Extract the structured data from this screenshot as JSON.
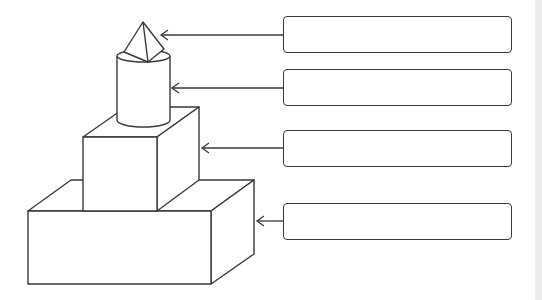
{
  "diagram": {
    "title": "",
    "shapes": [
      {
        "id": "pyramid",
        "name": "Pyramid",
        "label": ""
      },
      {
        "id": "cylinder",
        "name": "Cylinder",
        "label": ""
      },
      {
        "id": "cube",
        "name": "Cube",
        "label": ""
      },
      {
        "id": "prism",
        "name": "Rectangular prism",
        "label": ""
      }
    ],
    "label_boxes": [
      {
        "text": "",
        "x": 283,
        "y": 16,
        "w": 229,
        "h": 37
      },
      {
        "text": "",
        "x": 283,
        "y": 69,
        "w": 229,
        "h": 37
      },
      {
        "text": "",
        "x": 283,
        "y": 130,
        "w": 229,
        "h": 37
      },
      {
        "text": "",
        "x": 283,
        "y": 203,
        "w": 229,
        "h": 37
      }
    ],
    "colors": {
      "stroke": "#3a3a3a",
      "background": "#ffffff",
      "strip": "#ececec"
    }
  }
}
